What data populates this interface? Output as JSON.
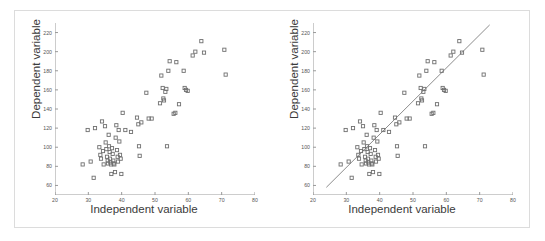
{
  "figure": {
    "panels": [
      {
        "name": "scatter-only",
        "xlabel": "Independent variable",
        "ylabel": "Dependent variable",
        "show_fit_line": false
      },
      {
        "name": "scatter-with-regression-line",
        "xlabel": "Independent variable",
        "ylabel": "Dependent variable",
        "show_fit_line": true
      }
    ]
  },
  "chart_data": {
    "type": "scatter",
    "title": "",
    "xlabel": "Independent variable",
    "ylabel": "Dependent variable",
    "xlim": [
      20,
      80
    ],
    "ylim": [
      50,
      230
    ],
    "xticks": [
      20,
      30,
      40,
      50,
      60,
      70,
      80
    ],
    "yticks": [
      60,
      80,
      100,
      120,
      140,
      160,
      180,
      200,
      220
    ],
    "grid": false,
    "legend": null,
    "marker": "open-square",
    "marker_color": "#6f6f6f",
    "fit_line": {
      "label": "least-squares regression line",
      "color": "#6f6f6f",
      "x_start": 24,
      "y_start": 58,
      "x_end": 73,
      "y_end": 228
    },
    "points": [
      [
        28.3,
        82
      ],
      [
        29.8,
        118
      ],
      [
        30.7,
        85
      ],
      [
        31.6,
        68
      ],
      [
        32.0,
        120
      ],
      [
        33.3,
        100
      ],
      [
        33.6,
        92
      ],
      [
        33.8,
        88
      ],
      [
        34.1,
        127
      ],
      [
        34.4,
        96
      ],
      [
        34.6,
        82
      ],
      [
        35.0,
        122
      ],
      [
        35.2,
        105
      ],
      [
        35.4,
        98
      ],
      [
        35.6,
        90
      ],
      [
        35.8,
        86
      ],
      [
        35.9,
        83
      ],
      [
        36.1,
        113
      ],
      [
        36.2,
        101
      ],
      [
        36.4,
        95
      ],
      [
        36.5,
        88
      ],
      [
        36.6,
        84
      ],
      [
        36.8,
        82
      ],
      [
        36.9,
        72
      ],
      [
        37.1,
        99
      ],
      [
        37.3,
        93
      ],
      [
        37.5,
        86
      ],
      [
        37.6,
        83
      ],
      [
        37.8,
        82
      ],
      [
        38.0,
        74
      ],
      [
        38.2,
        110
      ],
      [
        38.4,
        123
      ],
      [
        38.6,
        97
      ],
      [
        38.8,
        90
      ],
      [
        38.9,
        85
      ],
      [
        39.1,
        118
      ],
      [
        39.3,
        106
      ],
      [
        39.5,
        92
      ],
      [
        39.7,
        88
      ],
      [
        39.9,
        72
      ],
      [
        40.3,
        136
      ],
      [
        41.1,
        118
      ],
      [
        42.8,
        116
      ],
      [
        44.6,
        131
      ],
      [
        45.0,
        124
      ],
      [
        45.2,
        101
      ],
      [
        45.4,
        91
      ],
      [
        45.9,
        126
      ],
      [
        47.4,
        157
      ],
      [
        48.1,
        130
      ],
      [
        49.0,
        130
      ],
      [
        51.5,
        146
      ],
      [
        51.9,
        175
      ],
      [
        52.3,
        162
      ],
      [
        52.5,
        151
      ],
      [
        52.7,
        149
      ],
      [
        53.1,
        158
      ],
      [
        53.4,
        161
      ],
      [
        53.6,
        101
      ],
      [
        54.0,
        180
      ],
      [
        54.4,
        190
      ],
      [
        55.6,
        135
      ],
      [
        56.1,
        136
      ],
      [
        56.4,
        189
      ],
      [
        57.2,
        145
      ],
      [
        58.6,
        180
      ],
      [
        58.9,
        162
      ],
      [
        59.3,
        160
      ],
      [
        59.8,
        159
      ],
      [
        61.3,
        196
      ],
      [
        62.1,
        200
      ],
      [
        63.9,
        211
      ],
      [
        64.7,
        199
      ],
      [
        70.8,
        202
      ],
      [
        71.2,
        176
      ]
    ]
  }
}
